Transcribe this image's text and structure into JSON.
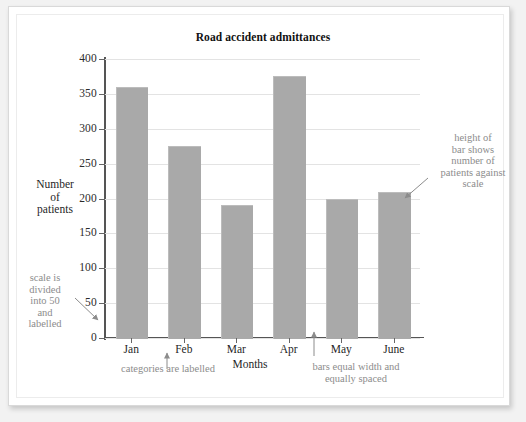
{
  "chart_data": {
    "type": "bar",
    "title": "Road accident admittances",
    "xlabel": "Months",
    "ylabel": "Number of patients",
    "categories": [
      "Jan",
      "Feb",
      "Mar",
      "Apr",
      "May",
      "June"
    ],
    "values": [
      360,
      275,
      190,
      375,
      200,
      210
    ],
    "ylim": [
      0,
      400
    ],
    "ytick_step": 50,
    "yticks": [
      0,
      50,
      100,
      150,
      200,
      250,
      300,
      350,
      400
    ],
    "ytick_labels": [
      "0",
      "50",
      "100",
      "150",
      "200",
      "250",
      "300",
      "350",
      "400"
    ],
    "grid": true,
    "legend": false,
    "bar_color": "#a9a9a9",
    "axis_color": "#555555",
    "grid_color": "#e3e3e3"
  },
  "chart": {
    "title": "Road accident admittances",
    "y_axis_label_lines": [
      "Number",
      "of",
      "patients"
    ],
    "x_axis_label": "Months"
  },
  "annotations": {
    "scale": {
      "name": "scale-annotation",
      "lines": [
        "scale is",
        "divided",
        "into 50",
        "and",
        "labelled"
      ],
      "text": "scale is divided into 50 and labelled"
    },
    "height": {
      "name": "bar-height-annotation",
      "lines": [
        "height of",
        "bar shows",
        "number of",
        "patients against",
        "scale"
      ],
      "text": "height of bar shows number of patients against scale"
    },
    "categories": {
      "name": "categories-annotation",
      "text": "categories are labelled"
    },
    "bars": {
      "name": "bars-annotation",
      "lines": [
        "bars equal width and",
        "equally spaced"
      ],
      "text": "bars equal width and equally spaced"
    }
  },
  "colors": {
    "bar": "#a9a9a9",
    "annotation_text": "#8c8c8c",
    "axis": "#555555",
    "grid": "#e3e3e3",
    "page": "#ffffff"
  }
}
